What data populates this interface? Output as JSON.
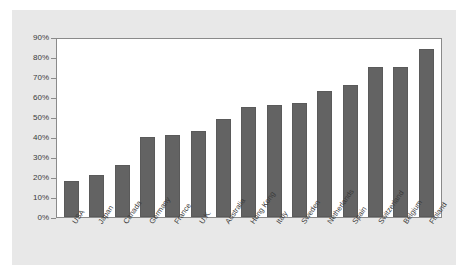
{
  "chart_data": {
    "type": "bar",
    "title": "",
    "subtitle": "",
    "xlabel": "",
    "ylabel": "",
    "ylim": [
      0,
      90
    ],
    "grid": false,
    "legend": "none",
    "y_tick_labels": [
      "90%",
      "80%",
      "70%",
      "60%",
      "50%",
      "40%",
      "30%",
      "20%",
      "10%",
      "0%"
    ],
    "y_tick_values": [
      90,
      80,
      70,
      60,
      50,
      40,
      30,
      20,
      10,
      0
    ],
    "categories": [
      "USA",
      "Japan",
      "Canada",
      "Germany",
      "France",
      "U.K.",
      "Australia",
      "Hong Kong",
      "Italy",
      "Sweden",
      "Netherlands",
      "Spain",
      "Switzerland",
      "Belgium",
      "Finland"
    ],
    "values": [
      18,
      21,
      26,
      40,
      41,
      43,
      49,
      55,
      56,
      57,
      63,
      66,
      75,
      75,
      84
    ],
    "bar_color": "#636363",
    "plot_background": "#ffffff",
    "figure_background": "#e8e8e8",
    "axis_color": "#8a8a8a"
  }
}
